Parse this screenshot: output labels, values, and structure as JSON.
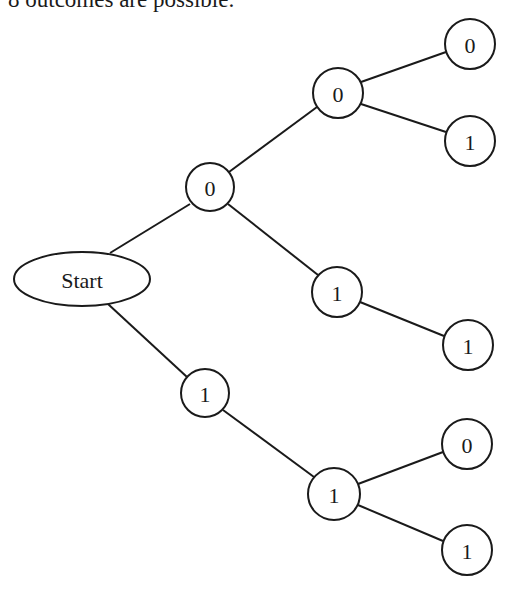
{
  "caption": "8 outcomes are possible:",
  "tree": {
    "root": {
      "id": "start",
      "label": "Start",
      "shape": "ellipse",
      "cx": 82,
      "cy": 279,
      "rx": 68,
      "ry": 27
    },
    "nodes": [
      {
        "id": "n0",
        "label": "0",
        "level": 1,
        "cx": 210,
        "cy": 187,
        "r": 24
      },
      {
        "id": "n1",
        "label": "1",
        "level": 1,
        "cx": 205,
        "cy": 393,
        "r": 24
      },
      {
        "id": "n00",
        "label": "0",
        "level": 2,
        "cx": 338,
        "cy": 93,
        "r": 25
      },
      {
        "id": "n01",
        "label": "1",
        "level": 2,
        "cx": 337,
        "cy": 292,
        "r": 25
      },
      {
        "id": "n11",
        "label": "1",
        "level": 2,
        "cx": 334,
        "cy": 494,
        "r": 26
      },
      {
        "id": "n000",
        "label": "0",
        "level": 3,
        "cx": 470,
        "cy": 44,
        "r": 25
      },
      {
        "id": "n001",
        "label": "1",
        "level": 3,
        "cx": 470,
        "cy": 141,
        "r": 25
      },
      {
        "id": "n011",
        "label": "1",
        "level": 3,
        "cx": 468,
        "cy": 345,
        "r": 25
      },
      {
        "id": "n110",
        "label": "0",
        "level": 3,
        "cx": 467,
        "cy": 444,
        "r": 25
      },
      {
        "id": "n111",
        "label": "1",
        "level": 3,
        "cx": 467,
        "cy": 550,
        "r": 25
      }
    ],
    "edges": [
      {
        "from": "start",
        "to": "n0"
      },
      {
        "from": "start",
        "to": "n1"
      },
      {
        "from": "n0",
        "to": "n00"
      },
      {
        "from": "n0",
        "to": "n01"
      },
      {
        "from": "n1",
        "to": "n11"
      },
      {
        "from": "n00",
        "to": "n000"
      },
      {
        "from": "n00",
        "to": "n001"
      },
      {
        "from": "n01",
        "to": "n011"
      },
      {
        "from": "n11",
        "to": "n110"
      },
      {
        "from": "n11",
        "to": "n111"
      }
    ]
  },
  "colors": {
    "stroke": "#1a1a1a",
    "fill": "#ffffff",
    "text": "#1a1a1a"
  }
}
